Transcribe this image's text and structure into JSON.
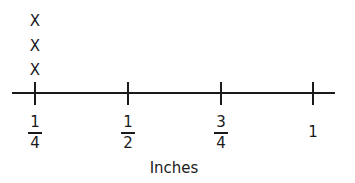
{
  "chart_data": {
    "type": "line_plot",
    "title": "",
    "xlabel": "Inches",
    "ylabel": "",
    "marker": "X",
    "categories": [
      "1/4",
      "1/2",
      "3/4",
      "1"
    ],
    "tick_labels": [
      {
        "value": 0.25,
        "numerator": "1",
        "denominator": "4"
      },
      {
        "value": 0.5,
        "numerator": "1",
        "denominator": "2"
      },
      {
        "value": 0.75,
        "numerator": "3",
        "denominator": "4"
      },
      {
        "value": 1,
        "whole": "1"
      }
    ],
    "values": [
      3,
      0,
      0,
      0
    ],
    "xlim": [
      0.25,
      1
    ],
    "grid": false,
    "legend": null
  },
  "colors": {
    "ink": "#1a1a1a",
    "background": "#ffffff"
  }
}
